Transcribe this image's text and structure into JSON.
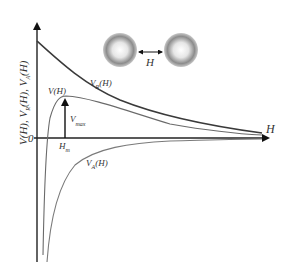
{
  "diagram": {
    "type": "DLVO interaction energy curves",
    "y_axis_label": {
      "text": "V(H), V",
      "sub1": "R",
      "mid": "(H), V",
      "sub2": "A",
      "end": "(H)"
    },
    "x_axis_label": "H",
    "origin_label": "0",
    "curves": [
      {
        "name": "V_R(H)",
        "label": "V",
        "sub": "R",
        "suffix": "(H)",
        "description": "repulsive potential, decays from positive value",
        "color": "#3a3a3a"
      },
      {
        "name": "V(H)",
        "label": "V(H)",
        "description": "total potential with energy barrier",
        "color": "#6a6a6a"
      },
      {
        "name": "V_A(H)",
        "label": "V",
        "sub": "A",
        "suffix": "(H)",
        "description": "attractive potential, negative",
        "color": "#7a7a7a"
      }
    ],
    "annotations": {
      "vmax": {
        "label": "V",
        "sub": "max"
      },
      "hm": {
        "label": "H",
        "sub": "m"
      },
      "separation": {
        "label": "H"
      }
    },
    "particles": [
      {
        "name": "particle-left",
        "cx": 120,
        "cy": 50,
        "r": 17
      },
      {
        "name": "particle-right",
        "cx": 180,
        "cy": 50,
        "r": 17
      }
    ],
    "colors": {
      "axis": "#222222",
      "particle_edge": "#8a8a8a",
      "particle_center": "#ffffff"
    }
  }
}
